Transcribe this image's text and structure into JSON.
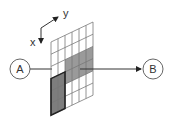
{
  "diagram": {
    "axes": {
      "x_label": "x",
      "y_label": "y"
    },
    "node_a": {
      "label": "A"
    },
    "node_b": {
      "label": "B"
    },
    "grid": {
      "columns": 6,
      "rows": 6,
      "shaded_light": [
        [
          2,
          2
        ],
        [
          2,
          3
        ],
        [
          2,
          4
        ],
        [
          2,
          5
        ],
        [
          3,
          2
        ],
        [
          3,
          3
        ],
        [
          3,
          4
        ],
        [
          3,
          5
        ]
      ],
      "shaded_dark": [
        [
          3,
          0
        ],
        [
          3,
          1
        ],
        [
          4,
          0
        ],
        [
          4,
          1
        ],
        [
          5,
          0
        ],
        [
          5,
          1
        ]
      ],
      "highlight_block": {
        "rows": [
          3,
          5
        ],
        "cols": [
          0,
          1
        ]
      }
    },
    "colors": {
      "line": "#333333",
      "light_fill": "#9a9a9a",
      "dark_fill": "#7a7a7a",
      "grid_line": "#777777"
    }
  }
}
